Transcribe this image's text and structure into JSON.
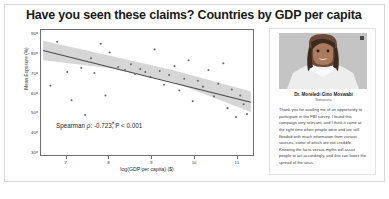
{
  "slide": {
    "title": "Have you seen these claims? Countries by GDP per capita"
  },
  "chart_data": {
    "type": "scatter",
    "title": "Have you seen these claims? Countries by GDP per capita",
    "xlabel": "log(GDP per capita) ($)",
    "ylabel": "Mean Exposure (%)",
    "xlim": [
      6.4,
      11.4
    ],
    "ylim": [
      28,
      92
    ],
    "xticks": [
      7,
      8,
      9,
      10,
      11
    ],
    "yticks": [
      90,
      80,
      70,
      60,
      50,
      40,
      30
    ],
    "grid": false,
    "legend": null,
    "annotation": "Spearman ρ: -0.723, P < 0.001",
    "annotation_parts": {
      "prefix": "Spearman ",
      "symbol": "ρ",
      "suffix": ": -0.723, P < 0.001"
    },
    "spearman_rho": -0.723,
    "p_value": "< 0.001",
    "point_color": "#6b6b6b",
    "line_color": "#4a4a4a",
    "band_color": "#c8c8c8",
    "regression_line": {
      "x": [
        6.45,
        11.35
      ],
      "y": [
        81.5,
        55.0
      ]
    },
    "confidence_band": {
      "x": [
        6.45,
        8.0,
        9.5,
        11.35
      ],
      "upper": [
        86.5,
        79.0,
        71.5,
        60.5
      ],
      "lower": [
        76.5,
        72.5,
        65.5,
        50.0
      ]
    },
    "points": [
      {
        "x": 6.62,
        "y": 63.5
      },
      {
        "x": 6.78,
        "y": 86.0
      },
      {
        "x": 7.02,
        "y": 70.5
      },
      {
        "x": 7.12,
        "y": 56.0
      },
      {
        "x": 7.35,
        "y": 72.5
      },
      {
        "x": 7.44,
        "y": 48.5
      },
      {
        "x": 7.58,
        "y": 77.5
      },
      {
        "x": 7.66,
        "y": 70.0
      },
      {
        "x": 7.81,
        "y": 85.0
      },
      {
        "x": 7.92,
        "y": 58.5
      },
      {
        "x": 8.02,
        "y": 80.5
      },
      {
        "x": 8.1,
        "y": 44.5
      },
      {
        "x": 8.22,
        "y": 73.0
      },
      {
        "x": 8.38,
        "y": 71.5
      },
      {
        "x": 8.52,
        "y": 74.5
      },
      {
        "x": 8.62,
        "y": 69.5
      },
      {
        "x": 8.74,
        "y": 72.0
      },
      {
        "x": 8.86,
        "y": 70.5
      },
      {
        "x": 8.98,
        "y": 68.0
      },
      {
        "x": 9.08,
        "y": 82.0
      },
      {
        "x": 9.2,
        "y": 71.0
      },
      {
        "x": 9.3,
        "y": 64.0
      },
      {
        "x": 9.42,
        "y": 69.0
      },
      {
        "x": 9.55,
        "y": 73.5
      },
      {
        "x": 9.66,
        "y": 61.0
      },
      {
        "x": 9.78,
        "y": 67.0
      },
      {
        "x": 9.88,
        "y": 76.5
      },
      {
        "x": 9.98,
        "y": 55.5
      },
      {
        "x": 10.1,
        "y": 66.0
      },
      {
        "x": 10.22,
        "y": 63.0
      },
      {
        "x": 10.35,
        "y": 71.5
      },
      {
        "x": 10.48,
        "y": 58.0
      },
      {
        "x": 10.58,
        "y": 64.5
      },
      {
        "x": 10.7,
        "y": 75.0
      },
      {
        "x": 10.8,
        "y": 52.0
      },
      {
        "x": 10.9,
        "y": 61.5
      },
      {
        "x": 11.0,
        "y": 47.5
      },
      {
        "x": 11.1,
        "y": 58.5
      },
      {
        "x": 11.18,
        "y": 54.0
      },
      {
        "x": 11.26,
        "y": 49.0
      }
    ]
  },
  "testimonial": {
    "name": "Dr. Moreledi Gino Moswabi",
    "role": "Botswana",
    "quote": "Thank you for availing me of an opportunity to participate in the FBI survey. I found this campaign very relevant, and I think it came at the right time when people were and are still flooded with much information from various sources, some of which are not credible. Knowing the facts versus myths will assist people to act accordingly, and this can lower the spread of the virus.",
    "photo_alt": "portrait-photo"
  }
}
